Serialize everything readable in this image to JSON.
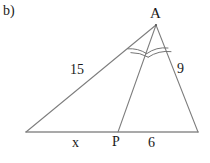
{
  "figure": {
    "part_label": "b)",
    "canvas": {
      "width": 210,
      "height": 163
    },
    "background_color": "#ffffff",
    "line_color": "#7a7a7a",
    "arc_color": "#6e6e6e",
    "text_color": "#1a1a1a",
    "vertices": {
      "apex": {
        "name": "A",
        "x": 156,
        "y": 25
      },
      "bottom_left": {
        "name": "",
        "x": 26,
        "y": 132
      },
      "bottom_right": {
        "name": "",
        "x": 198,
        "y": 132
      },
      "cevian_foot": {
        "name": "P",
        "x": 118,
        "y": 132
      }
    },
    "labels": {
      "apex": "A",
      "left_side": "15",
      "right_side": "9",
      "base_left_segment": "x",
      "cevian_point": "P",
      "base_right_segment": "6"
    },
    "angle_marks": {
      "description": "two double-arc marks at apex A indicating congruent angles (AP bisects angle A)",
      "count": 2,
      "arcs_per_mark": 2
    }
  }
}
